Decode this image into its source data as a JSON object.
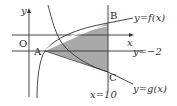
{
  "figure": {
    "axes": {
      "x_label": "x",
      "y_label": "y",
      "origin_label": "O"
    },
    "points": {
      "A": "A",
      "B": "B",
      "C": "C"
    },
    "curves": {
      "f": "y=f(x)",
      "g": "y=g(x)",
      "horizontal_line": "y=−2",
      "vertical_line": "x=10"
    },
    "shaded_region": "triangle ABC",
    "colors": {
      "shade": "#a9a9a9",
      "line": "#333333"
    }
  }
}
